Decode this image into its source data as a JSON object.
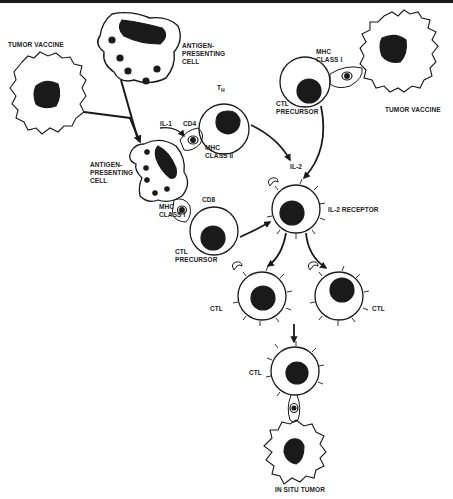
{
  "figure": {
    "type": "immunology-pathway-diagram",
    "colors": {
      "ink": "#1a1a1a",
      "background": "#ffffff"
    }
  },
  "labels": {
    "tumor_vaccine_left": "TUMOR VACCINE",
    "apc_top": "ANTIGEN-\nPRESENTING\nCELL",
    "th_main": "T",
    "th_sub": "H",
    "il1": "IL-1",
    "cd4": "CD4",
    "mhc_class_ii": "MHC\nCLASS II",
    "apc_mid": "ANTIGEN-\nPRESENTING\nCELL",
    "cd8": "CD8",
    "mhc_class_i_left": "MHC\nCLASS I",
    "ctl_precursor_left": "CTL\nPRECURSOR",
    "mhc_class_i_right": "MHC\nCLASS I",
    "tumor_vaccine_right": "TUMOR VACCINE",
    "ctl_precursor_right": "CTL\nPRECURSOR",
    "il2": "IL-2",
    "il2_receptor": "IL-2 RECEPTOR",
    "ctl_left": "CTL",
    "ctl_right": "CTL",
    "ctl_bottom": "CTL",
    "in_situ_tumor": "IN SITU TUMOR"
  },
  "nodes": [
    {
      "id": "tumor-vaccine-left",
      "kind": "tumor"
    },
    {
      "id": "apc-top",
      "kind": "antigen-presenting-cell"
    },
    {
      "id": "apc-mid",
      "kind": "antigen-presenting-cell"
    },
    {
      "id": "th-cell",
      "kind": "helper-t-cell"
    },
    {
      "id": "ctl-precursor-left",
      "kind": "ctl-precursor"
    },
    {
      "id": "ctl-precursor-right",
      "kind": "ctl-precursor"
    },
    {
      "id": "tumor-vaccine-right",
      "kind": "tumor"
    },
    {
      "id": "activated-ctl",
      "kind": "il2-receptor-cell"
    },
    {
      "id": "ctl-left",
      "kind": "ctl"
    },
    {
      "id": "ctl-right",
      "kind": "ctl"
    },
    {
      "id": "ctl-bottom",
      "kind": "ctl"
    },
    {
      "id": "in-situ-tumor",
      "kind": "tumor"
    }
  ],
  "edges": [
    {
      "from": "tumor-vaccine-left",
      "to": "apc-mid"
    },
    {
      "from": "apc-top",
      "to": "apc-mid"
    },
    {
      "from": "apc-mid",
      "to": "th-cell",
      "label": "IL-1"
    },
    {
      "from": "th-cell",
      "to": "activated-ctl",
      "label": "IL-2"
    },
    {
      "from": "ctl-precursor-right",
      "to": "activated-ctl"
    },
    {
      "from": "ctl-precursor-left",
      "to": "activated-ctl"
    },
    {
      "from": "activated-ctl",
      "to": "ctl-left"
    },
    {
      "from": "activated-ctl",
      "to": "ctl-right"
    },
    {
      "from": "ctl-left",
      "to": "ctl-bottom"
    },
    {
      "from": "ctl-bottom",
      "to": "in-situ-tumor"
    }
  ]
}
